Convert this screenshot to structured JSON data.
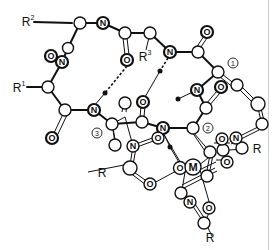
{
  "figure": {
    "type": "molecular-structure",
    "substituents": {
      "r1": {
        "base": "R",
        "sup": "1"
      },
      "r2": {
        "base": "R",
        "sup": "2"
      },
      "r3": {
        "base": "R",
        "sup": "3"
      },
      "r_a": "R",
      "r_b": "R",
      "r_c": "R"
    },
    "atoms": {
      "N": "N",
      "O": "O",
      "M": "M"
    },
    "position_markers": {
      "one": "1",
      "two": "2",
      "three": "3"
    },
    "colors": {
      "ink": "#111111",
      "background": "#ffffff",
      "edge_line": "#cfcfcf"
    }
  }
}
